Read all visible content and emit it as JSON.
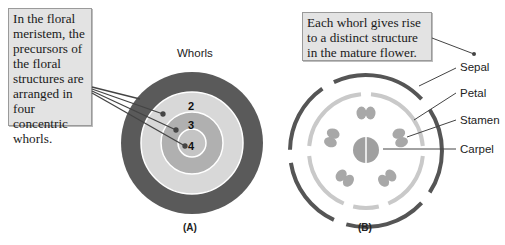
{
  "panel_a": {
    "callout_text": "In the floral meristem, the precursors of the floral structures are arranged in four concentric whorls.",
    "heading": "Whorls",
    "whorl_numbers": [
      "2",
      "3",
      "4"
    ],
    "caption": "(A)"
  },
  "panel_b": {
    "callout_text": "Each whorl gives rise to a distinct structure in the mature flower.",
    "labels": {
      "sepal": "Sepal",
      "petal": "Petal",
      "stamen": "Stamen",
      "carpel": "Carpel"
    },
    "caption": "(B)"
  },
  "colors": {
    "whorl_1": "#5a5a5a",
    "whorl_2": "#d8d8d8",
    "whorl_3": "#b0b0b0",
    "whorl_4": "#c4c4c4",
    "sepal": "#555555",
    "petal": "#c9c9c9",
    "stamen": "#a8a8a8",
    "carpel": "#a0a0a0",
    "callout_bg": "#e3e3e3"
  }
}
